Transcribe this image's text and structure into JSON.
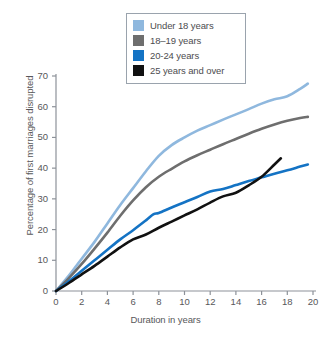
{
  "chart_data": {
    "type": "line",
    "title": "",
    "xlabel": "Duration in years",
    "ylabel": "Percentage of first marriages disrupted",
    "xlim": [
      0,
      20
    ],
    "ylim": [
      0,
      70
    ],
    "xticks": [
      0,
      2,
      4,
      6,
      8,
      10,
      12,
      14,
      16,
      18,
      20
    ],
    "yticks": [
      0,
      10,
      20,
      30,
      40,
      50,
      60,
      70
    ],
    "grid": false,
    "legend_position": "top-center",
    "series": [
      {
        "name": "Under 18 years",
        "color": "#8FB8DE",
        "x": [
          0,
          1,
          2,
          3,
          4,
          5,
          6,
          7,
          8,
          9,
          10,
          11,
          12,
          13,
          14,
          15,
          16,
          17,
          18,
          19,
          19.6
        ],
        "values": [
          0,
          5.0,
          10.5,
          16.0,
          22.0,
          28.0,
          33.5,
          39.0,
          44.0,
          47.5,
          50.0,
          52.2,
          54.0,
          55.8,
          57.5,
          59.2,
          61.0,
          62.4,
          63.4,
          65.8,
          67.5
        ]
      },
      {
        "name": "18–19 years",
        "color": "#6E6E6E",
        "x": [
          0,
          1,
          2,
          3,
          4,
          5,
          6,
          7,
          8,
          9,
          10,
          11,
          12,
          13,
          14,
          15,
          16,
          17,
          18,
          19,
          19.6
        ],
        "values": [
          0,
          4.2,
          8.8,
          13.8,
          19.0,
          24.5,
          29.5,
          33.8,
          37.2,
          39.8,
          42.2,
          44.2,
          46.0,
          47.8,
          49.5,
          51.2,
          52.8,
          54.2,
          55.4,
          56.3,
          56.7
        ]
      },
      {
        "name": "20-24 years",
        "color": "#1473C4",
        "x": [
          0,
          1,
          2,
          3,
          4,
          5,
          6,
          7,
          7.6,
          8,
          9,
          10,
          11,
          12,
          13,
          14,
          15,
          16,
          17,
          18,
          19,
          19.6
        ],
        "values": [
          0,
          3.2,
          6.6,
          10.0,
          13.4,
          16.8,
          19.8,
          23.0,
          25.0,
          25.4,
          27.2,
          28.9,
          30.6,
          32.4,
          33.2,
          34.5,
          35.8,
          37.0,
          38.2,
          39.3,
          40.5,
          41.2
        ]
      },
      {
        "name": "25 years and over",
        "color": "#111111",
        "x": [
          0,
          1,
          2,
          3,
          4,
          5,
          6,
          7,
          8,
          9,
          10,
          11,
          12,
          13,
          14,
          15,
          16,
          17,
          17.5
        ],
        "values": [
          0,
          2.6,
          5.4,
          8.2,
          11.2,
          14.2,
          16.8,
          18.4,
          20.6,
          22.6,
          24.6,
          26.6,
          28.8,
          30.8,
          32.0,
          34.4,
          37.2,
          41.2,
          43.2
        ]
      }
    ]
  },
  "legend": {
    "items": [
      {
        "label": "Under 18 years",
        "color": "#8FB8DE"
      },
      {
        "label": "18–19 years",
        "color": "#6E6E6E"
      },
      {
        "label": "20-24 years",
        "color": "#1473C4"
      },
      {
        "label": "25 years and over",
        "color": "#111111"
      }
    ]
  },
  "axes": {
    "x_title": "Duration in years",
    "y_title": "Percentage of first marriages disrupted",
    "x_tick_labels": [
      "0",
      "2",
      "4",
      "6",
      "8",
      "10",
      "12",
      "14",
      "16",
      "18",
      "20"
    ],
    "y_tick_labels": [
      "0",
      "10",
      "20",
      "30",
      "40",
      "50",
      "60",
      "70"
    ]
  }
}
